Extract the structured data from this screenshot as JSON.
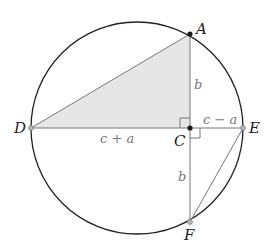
{
  "diagram": {
    "type": "geometry",
    "colors": {
      "circle_stroke": "#222222",
      "line_stroke": "#777777",
      "shade_fill": "#e6e6e6",
      "point_dark": "#1a1a1a",
      "point_light": "#999999"
    },
    "circle": {
      "cx": 137,
      "cy": 128,
      "r": 106
    },
    "points": {
      "A": {
        "label": "A",
        "x": 190,
        "y": 34
      },
      "C": {
        "label": "C",
        "x": 190,
        "y": 128
      },
      "D": {
        "label": "D",
        "x": 31,
        "y": 128
      },
      "E": {
        "label": "E",
        "x": 243,
        "y": 128
      },
      "F": {
        "label": "F",
        "x": 190,
        "y": 222
      }
    },
    "segment_labels": {
      "AC": "b",
      "CF": "b",
      "DC": "c + a",
      "CE": "c − a"
    },
    "right_angles": [
      "DCA",
      "ECF"
    ],
    "shaded_region": "triangle DCA"
  }
}
